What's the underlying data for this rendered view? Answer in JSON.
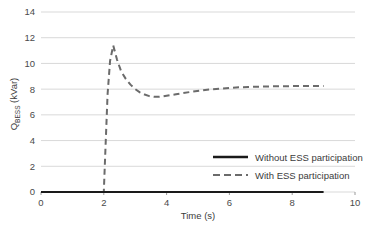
{
  "chart_data": {
    "type": "line",
    "title": "",
    "xlabel": "Time (s)",
    "ylabel": "Q_BESS (kVar)",
    "ylabel_main": "Q",
    "ylabel_sub": "BESS",
    "ylabel_unit": " (kVar)",
    "xlim": [
      0,
      10
    ],
    "ylim": [
      0,
      14
    ],
    "xticks": [
      0,
      2,
      4,
      6,
      8,
      10
    ],
    "yticks": [
      0,
      2,
      4,
      6,
      8,
      10,
      12,
      14
    ],
    "xtick_labels": [
      "0",
      "2",
      "4",
      "6",
      "8",
      "10"
    ],
    "ytick_labels": [
      "0",
      "2",
      "4",
      "6",
      "8",
      "10",
      "12",
      "14"
    ],
    "grid": "horizontal",
    "grid_color": "#d9d9d9",
    "legend_position": "inside-right-lower",
    "series": [
      {
        "name": "Without ESS participation",
        "style": "solid",
        "color": "#1a1a1a",
        "width": 2.2,
        "x": [
          0,
          1,
          2,
          3,
          4,
          5,
          6,
          7,
          8,
          9
        ],
        "values": [
          0,
          0,
          0,
          0,
          0,
          0,
          0,
          0,
          0,
          0
        ]
      },
      {
        "name": "With ESS participation",
        "style": "dashed",
        "color": "#6b6b6b",
        "width": 2.0,
        "x": [
          0,
          0.5,
          1.0,
          1.5,
          1.95,
          2.0,
          2.05,
          2.12,
          2.2,
          2.3,
          2.42,
          2.55,
          2.7,
          2.85,
          3.0,
          3.15,
          3.3,
          3.45,
          3.6,
          3.75,
          3.9,
          4.1,
          4.3,
          4.5,
          4.8,
          5.1,
          5.4,
          5.7,
          6.0,
          6.3,
          6.6,
          7.0,
          7.4,
          7.8,
          8.2,
          8.6,
          9.0
        ],
        "values": [
          0,
          0,
          0,
          0,
          0,
          0,
          3.2,
          7.6,
          10.2,
          11.4,
          10.3,
          9.4,
          8.8,
          8.35,
          8.0,
          7.75,
          7.58,
          7.46,
          7.4,
          7.4,
          7.44,
          7.52,
          7.6,
          7.68,
          7.8,
          7.9,
          7.98,
          8.04,
          8.1,
          8.14,
          8.17,
          8.2,
          8.22,
          8.23,
          8.24,
          8.25,
          8.25
        ]
      }
    ],
    "legend_entries": [
      {
        "label": "Without ESS participation",
        "style": "solid",
        "color": "#1a1a1a"
      },
      {
        "label": "With ESS participation",
        "style": "dashed",
        "color": "#6b6b6b"
      }
    ]
  }
}
